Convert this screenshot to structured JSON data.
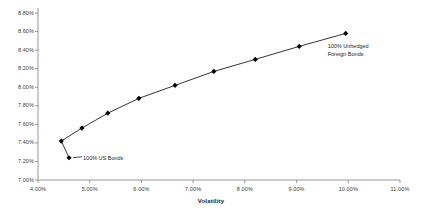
{
  "chart_data": {
    "type": "line",
    "title": "",
    "xlabel": "Volatility",
    "ylabel": "",
    "xlim": [
      4.0,
      11.0
    ],
    "ylim": [
      7.0,
      8.8
    ],
    "grid": false,
    "legend": "none",
    "x_ticks": [
      "4.00%",
      "5.00%",
      "6.00%",
      "7.00%",
      "8.00%",
      "9.00%",
      "10.00%",
      "11.00%"
    ],
    "x_tick_values": [
      4.0,
      5.0,
      6.0,
      7.0,
      8.0,
      9.0,
      10.0,
      11.0
    ],
    "y_ticks": [
      "7.00%",
      "7.20%",
      "7.40%",
      "7.60%",
      "7.80%",
      "8.00%",
      "8.20%",
      "8.40%",
      "8.60%",
      "8.80%"
    ],
    "y_tick_values": [
      7.0,
      7.2,
      7.4,
      7.6,
      7.8,
      8.0,
      8.2,
      8.4,
      8.6,
      8.8
    ],
    "series": [
      {
        "name": "Efficient Frontier",
        "marker": "diamond",
        "color": "#000000",
        "points": [
          {
            "x": 4.6,
            "y": 7.24
          },
          {
            "x": 4.45,
            "y": 7.42
          },
          {
            "x": 4.85,
            "y": 7.56
          },
          {
            "x": 5.35,
            "y": 7.72
          },
          {
            "x": 5.95,
            "y": 7.88
          },
          {
            "x": 6.65,
            "y": 8.02
          },
          {
            "x": 7.4,
            "y": 8.17
          },
          {
            "x": 8.2,
            "y": 8.3
          },
          {
            "x": 9.05,
            "y": 8.44
          },
          {
            "x": 9.95,
            "y": 8.58
          }
        ]
      }
    ],
    "annotations": [
      {
        "text": "100% US Bonds",
        "x": 4.6,
        "y": 7.24,
        "position": "right"
      },
      {
        "text": "100% Unhedged",
        "x": 9.95,
        "y": 8.58,
        "position": "below-right"
      },
      {
        "text": "Foreign Bonds",
        "x": 9.95,
        "y": 8.58,
        "position": "below-right-2"
      }
    ]
  },
  "axis": {
    "x_title": "Volatility"
  },
  "annotations": {
    "us_bonds": "100% US Bonds",
    "foreign_line1": "100% Unhedged",
    "foreign_line2": "Foreign Bonds"
  },
  "y_tick_labels": [
    "8.80%",
    "8.60%",
    "8.40%",
    "8.20%",
    "8.00%",
    "7.80%",
    "7.60%",
    "7.40%",
    "7.20%",
    "7.00%"
  ],
  "x_tick_labels": [
    "4.00%",
    "5.00%",
    "6.00%",
    "7.00%",
    "8.00%",
    "9.00%",
    "10.00%",
    "11.00%"
  ]
}
